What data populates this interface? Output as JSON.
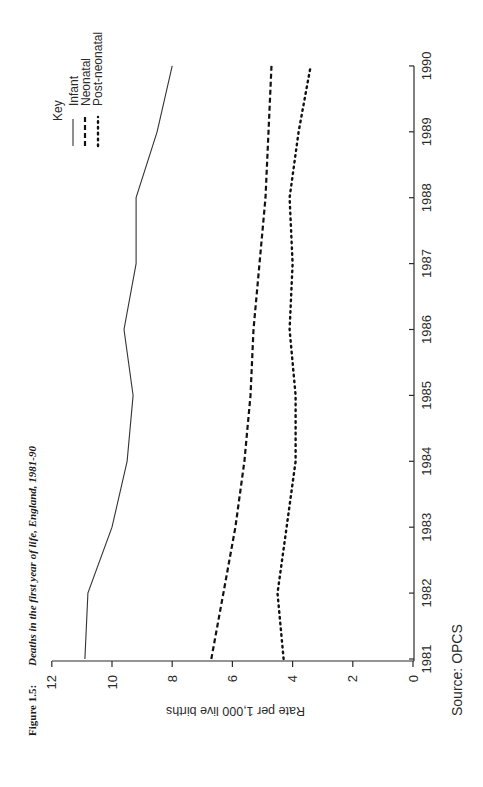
{
  "figure": {
    "number": "Figure 1.5:",
    "title": "Deaths in the first year of life, England, 1981-90",
    "source": "Source: OPCS"
  },
  "legend": {
    "title": "Key",
    "items": [
      {
        "label": "Infant",
        "style": "solid"
      },
      {
        "label": "Neonatal",
        "style": "dashed"
      },
      {
        "label": "Post-neonatal",
        "style": "dotted"
      }
    ]
  },
  "axes": {
    "x_label": "",
    "y_label": "Rate per 1,000 live births",
    "x_ticks": [
      "1981",
      "1982",
      "1983",
      "1984",
      "1985",
      "1986",
      "1987",
      "1988",
      "1989",
      "1990"
    ],
    "y_ticks": [
      "0",
      "2",
      "4",
      "6",
      "8",
      "10",
      "12"
    ]
  },
  "chart_data": {
    "type": "line",
    "title": "Figure 1.5: Deaths in the first year of life, England, 1981-90",
    "xlabel": "",
    "ylabel": "Rate per 1,000 live births",
    "x": [
      1981,
      1982,
      1983,
      1984,
      1985,
      1986,
      1987,
      1988,
      1989,
      1990
    ],
    "ylim": [
      0,
      12
    ],
    "xlim": [
      1981,
      1990
    ],
    "grid": false,
    "legend_position": "top-right (key)",
    "orientation": "rotated 90 degrees counter-clockwise on page",
    "series": [
      {
        "name": "Infant",
        "style": "solid",
        "values": [
          10.9,
          10.8,
          10.0,
          9.5,
          9.3,
          9.6,
          9.2,
          9.2,
          8.5,
          8.0
        ]
      },
      {
        "name": "Neonatal",
        "style": "dashed",
        "values": [
          6.7,
          6.3,
          5.9,
          5.6,
          5.4,
          5.3,
          5.1,
          4.9,
          4.8,
          4.7
        ]
      },
      {
        "name": "Post-neonatal",
        "style": "dotted",
        "values": [
          4.3,
          4.5,
          4.2,
          3.9,
          3.9,
          4.1,
          4.0,
          4.1,
          3.8,
          3.4
        ]
      }
    ],
    "source": "Source: OPCS"
  }
}
